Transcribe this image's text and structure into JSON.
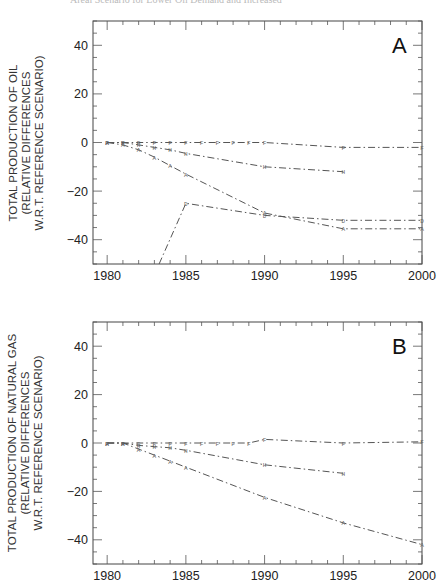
{
  "caption": "Areal Scenario for Lower Oil Demand and Increased",
  "chart_data": [
    {
      "type": "line",
      "panel_label": "A",
      "title": "",
      "xlabel": "",
      "ylabel": "TOTAL PRODUCTION OF OIL (RELATIVE DIFFERENCES W.R.T. REFERENCE SCENARIO)",
      "ylabel_lines": [
        "TOTAL PRODUCTION OF OIL",
        "(RELATIVE DIFFERENCES",
        "W.R.T. REFERENCE SCENARIO)"
      ],
      "xlim": [
        1979,
        2000
      ],
      "ylim": [
        -50,
        50
      ],
      "xticks": [
        1980,
        1985,
        1990,
        1995,
        2000
      ],
      "yticks": [
        40,
        20,
        0,
        -20,
        -40
      ],
      "grid": false,
      "series": [
        {
          "name": "F",
          "marker": "F",
          "x": [
            1980,
            1981,
            1982,
            1983,
            1984,
            1985,
            1986,
            1987,
            1988,
            1989,
            1990,
            1995,
            2000
          ],
          "values": [
            0,
            0,
            0,
            0,
            0,
            0,
            0,
            0,
            0,
            0,
            0,
            -2,
            -2
          ]
        },
        {
          "name": "H",
          "marker": "H",
          "x": [
            1980,
            1981,
            1982,
            1983,
            1984,
            1985,
            1990,
            1995
          ],
          "values": [
            0,
            0,
            -1,
            -2,
            -3,
            -4.5,
            -10,
            -12
          ]
        },
        {
          "name": "A",
          "marker": "A",
          "x": [
            1980,
            1981,
            1982,
            1983,
            1984,
            1985,
            1990,
            1995,
            2000
          ],
          "values": [
            0,
            -1,
            -3,
            -6,
            -9.5,
            -13,
            -29,
            -35.5,
            -35.5
          ]
        },
        {
          "name": "D",
          "marker": "D",
          "x": [
            1983.3,
            1985,
            1990,
            1995,
            2000
          ],
          "values": [
            -50,
            -25,
            -30,
            -32,
            -32
          ]
        }
      ]
    },
    {
      "type": "line",
      "panel_label": "B",
      "title": "",
      "xlabel": "",
      "ylabel": "TOTAL PRODUCTION OF NATURAL GAS (RELATIVE DIFFERENCES W.R.T. REFERENCE SCENARIO)",
      "ylabel_lines": [
        "TOTAL PRODUCTION OF NATURAL GAS",
        "(RELATIVE DIFFERENCES",
        "W.R.T. REFERENCE SCENARIO)"
      ],
      "xlim": [
        1979,
        2000
      ],
      "ylim": [
        -50,
        50
      ],
      "xticks": [
        1980,
        1985,
        1990,
        1995,
        2000
      ],
      "yticks": [
        40,
        20,
        0,
        -20,
        -40
      ],
      "grid": false,
      "series": [
        {
          "name": "F",
          "marker": "F",
          "x": [
            1980,
            1981,
            1982,
            1983,
            1984,
            1985,
            1986,
            1987,
            1988,
            1989,
            1990,
            1995,
            2000
          ],
          "values": [
            0,
            0,
            0,
            0,
            0,
            0,
            0,
            0,
            0,
            0,
            1.5,
            0,
            0.5
          ]
        },
        {
          "name": "H",
          "marker": "H",
          "x": [
            1980,
            1981,
            1982,
            1983,
            1984,
            1985,
            1990,
            1995
          ],
          "values": [
            0,
            0,
            -1,
            -1.5,
            -2,
            -3,
            -9,
            -12.5
          ]
        },
        {
          "name": "A",
          "marker": "A",
          "x": [
            1980,
            1981,
            1982,
            1983,
            1984,
            1985,
            1990,
            1995,
            2000
          ],
          "values": [
            0,
            0,
            -2.5,
            -5,
            -7.5,
            -10,
            -22.5,
            -33,
            -42
          ]
        }
      ]
    }
  ]
}
